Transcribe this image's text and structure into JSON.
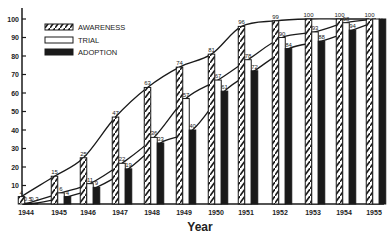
{
  "chart_data": {
    "type": "bar",
    "title": "",
    "xlabel": "Year",
    "ylabel": "",
    "ylim": [
      0,
      100
    ],
    "yticks": [
      10,
      20,
      30,
      40,
      50,
      60,
      70,
      80,
      90,
      100
    ],
    "categories": [
      "1944",
      "1945",
      "1946",
      "1947",
      "1948",
      "1949",
      "1950",
      "1951",
      "1952",
      "1953",
      "1954",
      "1955"
    ],
    "series": [
      {
        "name": "AWARENESS",
        "style": "hatched",
        "values": [
          4,
          15,
          25,
          47,
          63,
          74,
          81,
          96,
          99,
          100,
          100,
          100
        ]
      },
      {
        "name": "TRIAL",
        "style": "open",
        "values": [
          0.5,
          6,
          11,
          22,
          36,
          57,
          67,
          78,
          90,
          93,
          98,
          100
        ]
      },
      {
        "name": "ADOPTION",
        "style": "solid",
        "values": [
          0.3,
          4,
          9,
          19,
          33,
          40,
          61,
          72,
          84,
          88,
          94,
          100
        ]
      }
    ],
    "value_labels": {
      "AWARENESS": [
        "4",
        "15",
        "25",
        "47",
        "63",
        "74",
        "81",
        "96",
        "99",
        "100",
        "100",
        "100"
      ],
      "TRIAL": [
        "0.5",
        "6",
        "11",
        "22",
        "36",
        "57",
        "67",
        "78",
        "90",
        "93",
        "98",
        ""
      ],
      "ADOPTION": [
        "0.3",
        "4",
        "9",
        "19",
        "33",
        "40",
        "61",
        "72",
        "84",
        "88",
        "94",
        ""
      ]
    },
    "smoothed_curves": true,
    "grid": false,
    "legend_position": "upper-left"
  },
  "legend": {
    "awareness": "AWARENESS",
    "trial": "TRIAL",
    "adoption": "ADOPTION"
  },
  "axis": {
    "x_title": "Year"
  },
  "colors": {
    "ink": "#1a1a1a",
    "background": "#ffffff"
  }
}
